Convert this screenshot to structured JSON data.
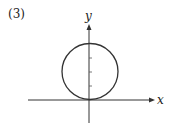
{
  "problem_number": "(3)",
  "axes": {
    "x_label": "x",
    "y_label": "y"
  },
  "figure": {
    "circle": {
      "center": [
        0,
        2
      ],
      "radius": 2
    },
    "y_ticks": [
      1,
      2,
      3
    ]
  }
}
